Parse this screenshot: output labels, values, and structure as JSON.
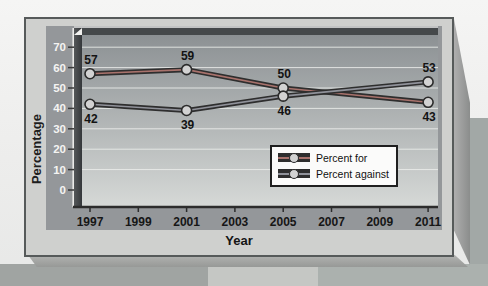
{
  "axes": {
    "y_label": "Percentage",
    "x_label": "Year"
  },
  "chart_data": {
    "type": "line",
    "x": [
      1997,
      2001,
      2005,
      2011
    ],
    "x_ticks": [
      "1997",
      "1999",
      "2001",
      "2003",
      "2005",
      "2007",
      "2009",
      "2011"
    ],
    "y_ticks": [
      0,
      10,
      20,
      30,
      40,
      50,
      60,
      70
    ],
    "ylim": [
      0,
      75
    ],
    "xlim": [
      1996,
      2012
    ],
    "xlabel": "Year",
    "ylabel": "Percentage",
    "grid": "horizontal white gridlines every 10 units",
    "legend_position": "inside lower-right",
    "plot_style": "3D beveled gray gradient plot area with dark axis walls",
    "series": [
      {
        "name": "Percent for",
        "values": [
          57,
          59,
          50,
          43
        ],
        "label_placement": [
          "above",
          "above",
          "above",
          "below"
        ],
        "line_color": "#2e2e2e",
        "core_color": "#a8726c",
        "marker": "circle"
      },
      {
        "name": "Percent against",
        "values": [
          42,
          39,
          46,
          53
        ],
        "label_placement": [
          "below",
          "below",
          "below",
          "above"
        ],
        "line_color": "#2e2e2e",
        "core_color": "#90929a",
        "marker": "circle"
      }
    ]
  },
  "legend": {
    "items": [
      {
        "label": "Percent for"
      },
      {
        "label": "Percent against"
      }
    ]
  },
  "style_colors": {
    "page_bg": "#efefee",
    "plaque_bg": "#cfd0ce",
    "inner_chart_bg": "#94979a",
    "plot_gradient_top": "#898e91",
    "plot_gradient_bottom": "#d6d9d7",
    "wall_dark": "#34373a",
    "gridline": "#eceeec",
    "y_tick_text": "#f4f4f2",
    "x_tick_text": "#161616",
    "point_label_text": "#131313",
    "marker_fill": "#d2d2d2"
  }
}
